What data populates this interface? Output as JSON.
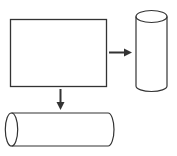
{
  "diagram": {
    "type": "shape-transformation",
    "stroke_color": "#333333",
    "background": "#ffffff",
    "shapes": [
      {
        "id": "sheet",
        "kind": "rectangle",
        "label": ""
      },
      {
        "id": "vertical-cylinder",
        "kind": "cylinder",
        "orientation": "vertical",
        "label": ""
      },
      {
        "id": "horizontal-cylinder",
        "kind": "cylinder",
        "orientation": "horizontal",
        "label": ""
      }
    ],
    "arrows": [
      {
        "from": "sheet",
        "to": "vertical-cylinder",
        "direction": "right"
      },
      {
        "from": "sheet",
        "to": "horizontal-cylinder",
        "direction": "down"
      }
    ]
  }
}
